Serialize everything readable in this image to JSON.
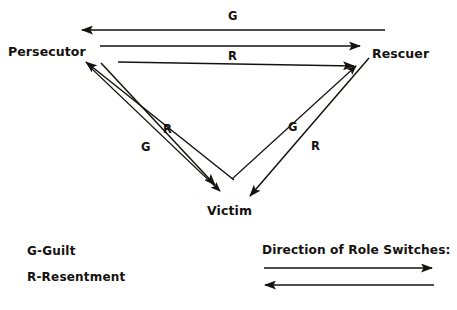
{
  "figure": {
    "type": "diagram",
    "subtype": "drama-triangle",
    "background_color": "#ffffff",
    "ink_color": "#15120f"
  },
  "nodes": [
    {
      "id": "persecutor",
      "label": "Persecutor",
      "x": 8,
      "y": 44
    },
    {
      "id": "rescuer",
      "label": "Rescuer",
      "x": 372,
      "y": 46
    },
    {
      "id": "victim",
      "label": "Victim",
      "x": 207,
      "y": 203
    }
  ],
  "edge_labels": [
    {
      "id": "top-guilt",
      "label": "G",
      "x": 228,
      "y": 9,
      "edge": "rescuer-to-persecutor"
    },
    {
      "id": "top-resentment",
      "label": "R",
      "x": 228,
      "y": 49,
      "edge": "persecutor-to-rescuer"
    },
    {
      "id": "left-resentment",
      "label": "R",
      "x": 163,
      "y": 122,
      "edge": "victim-to-persecutor"
    },
    {
      "id": "left-guilt",
      "label": "G",
      "x": 141,
      "y": 140,
      "edge": "persecutor-to-victim"
    },
    {
      "id": "right-guilt",
      "label": "G",
      "x": 288,
      "y": 120,
      "edge": "victim-to-rescuer"
    },
    {
      "id": "right-resentment",
      "label": "R",
      "x": 311,
      "y": 139,
      "edge": "rescuer-to-victim"
    }
  ],
  "arrows": [
    {
      "id": "arrow-guilt-rescuer-to-persecutor",
      "from": [
        385,
        30
      ],
      "to": [
        80,
        30
      ],
      "head": "to"
    },
    {
      "id": "arrow-resentment-persecutor-to-rescuer",
      "from": [
        100,
        46
      ],
      "to": [
        362,
        46
      ],
      "head": "to"
    },
    {
      "id": "arrow-resentment-victim-to-rescuer-upper",
      "from": [
        118,
        62
      ],
      "to": [
        356,
        66
      ],
      "head": "to"
    },
    {
      "id": "arrow-guilt-victim-to-persecutor",
      "from": [
        232,
        178
      ],
      "to": [
        84,
        60
      ],
      "head": "to"
    },
    {
      "id": "arrow-guilt-persecutor-to-victim",
      "from": [
        90,
        66
      ],
      "to": [
        221,
        193
      ],
      "head": "to"
    },
    {
      "id": "arrow-resentment-victim-to-persecutor",
      "from": [
        101,
        63
      ],
      "to": [
        216,
        186
      ],
      "head": "to"
    },
    {
      "id": "arrow-guilt-victim-to-rescuer",
      "from": [
        232,
        178
      ],
      "to": [
        358,
        64
      ],
      "head": "to"
    },
    {
      "id": "arrow-resentment-rescuer-to-victim",
      "from": [
        368,
        60
      ],
      "to": [
        249,
        198
      ],
      "head": "to"
    }
  ],
  "legend": {
    "items": [
      {
        "id": "legend-guilt",
        "text": "G-Guilt",
        "x": 27,
        "y": 244
      },
      {
        "id": "legend-resentment",
        "text": "R-Resentment",
        "x": 27,
        "y": 270
      }
    ]
  },
  "role_switches": {
    "title": "Direction of Role Switches:",
    "title_x": 262,
    "title_y": 243,
    "arrows": [
      {
        "id": "role-switch-arrow-right",
        "from": [
          264,
          268
        ],
        "to": [
          434,
          268
        ],
        "head": "to"
      },
      {
        "id": "role-switch-arrow-left",
        "from": [
          434,
          285
        ],
        "to": [
          263,
          285
        ],
        "head": "to"
      }
    ]
  }
}
